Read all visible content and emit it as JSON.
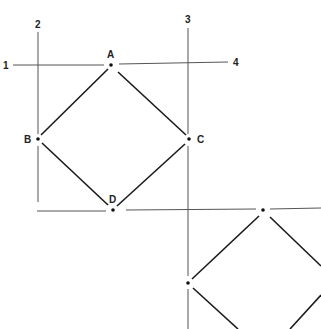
{
  "diagram": {
    "guide_lines": [
      {
        "id": "1",
        "label": "1",
        "x1": 13,
        "y1": 65,
        "x2": 104,
        "y2": 65
      },
      {
        "id": "1b",
        "label": "",
        "x1": 119,
        "y1": 64,
        "x2": 228,
        "y2": 62
      },
      {
        "id": "2",
        "label": "2",
        "x1": 38,
        "y1": 32,
        "x2": 38,
        "y2": 134
      },
      {
        "id": "2b",
        "label": "",
        "x1": 38,
        "y1": 146,
        "x2": 38,
        "y2": 202
      },
      {
        "id": "3",
        "label": "3",
        "x1": 188,
        "y1": 28,
        "x2": 188,
        "y2": 134
      },
      {
        "id": "3b",
        "label": "",
        "x1": 188,
        "y1": 146,
        "x2": 188,
        "y2": 276
      },
      {
        "id": "3c",
        "label": "",
        "x1": 188,
        "y1": 289,
        "x2": 188,
        "y2": 329
      },
      {
        "id": "bottom-left",
        "label": "",
        "x1": 37,
        "y1": 211,
        "x2": 106,
        "y2": 211
      },
      {
        "id": "bottom-right",
        "label": "",
        "x1": 126,
        "y1": 210,
        "x2": 256,
        "y2": 209
      },
      {
        "id": "bottom-right-2",
        "label": "",
        "x1": 270,
        "y1": 209,
        "x2": 321,
        "y2": 208
      }
    ],
    "line_labels": [
      {
        "text": "1",
        "x": 3,
        "y": 69
      },
      {
        "text": "2",
        "x": 35,
        "y": 28
      },
      {
        "text": "3",
        "x": 185,
        "y": 23
      },
      {
        "text": "4",
        "x": 233,
        "y": 66
      }
    ],
    "points": [
      {
        "name": "A",
        "x": 111,
        "y": 65,
        "label_x": 107,
        "label_y": 58
      },
      {
        "name": "B",
        "x": 38,
        "y": 139,
        "label_x": 24,
        "label_y": 143
      },
      {
        "name": "C",
        "x": 189,
        "y": 139,
        "label_x": 197,
        "label_y": 143
      },
      {
        "name": "D",
        "x": 113,
        "y": 210,
        "label_x": 109,
        "label_y": 203
      }
    ],
    "square_edges": [
      {
        "from": "A",
        "x1": 108,
        "y1": 69,
        "x2": 41,
        "y2": 135
      },
      {
        "from": "A",
        "x1": 118,
        "y1": 72,
        "x2": 186,
        "y2": 135
      },
      {
        "from": "B",
        "x1": 42,
        "y1": 143,
        "x2": 108,
        "y2": 205
      },
      {
        "from": "C",
        "x1": 185,
        "y1": 144,
        "x2": 117,
        "y2": 206
      }
    ],
    "second_points": [
      {
        "name": "",
        "x": 263,
        "y": 210
      },
      {
        "name": "",
        "x": 188,
        "y": 283
      }
    ],
    "second_edges": [
      {
        "x1": 259,
        "y1": 216,
        "x2": 192,
        "y2": 279
      },
      {
        "x1": 270,
        "y1": 217,
        "x2": 321,
        "y2": 266
      },
      {
        "x1": 193,
        "y1": 288,
        "x2": 238,
        "y2": 329
      },
      {
        "x1": 321,
        "y1": 295,
        "x2": 290,
        "y2": 329
      }
    ]
  }
}
